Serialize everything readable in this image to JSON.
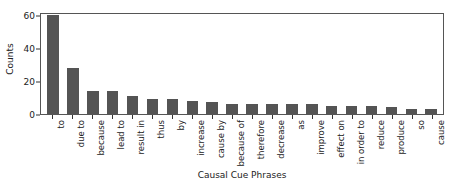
{
  "chart_data": {
    "type": "bar",
    "title": "",
    "xlabel": "Causal Cue Phrases",
    "ylabel": "Counts",
    "ylim": [
      0,
      62
    ],
    "yticks": [
      0,
      20,
      40,
      60
    ],
    "grid": false,
    "legend": null,
    "bar_color": "#545454",
    "categories": [
      "to",
      "due to",
      "because",
      "lead to",
      "result in",
      "thus",
      "by",
      "increase",
      "cause by",
      "because of",
      "therefore",
      "decrease",
      "as",
      "improve",
      "effect on",
      "in order to",
      "reduce",
      "produce",
      "so",
      "cause"
    ],
    "values": [
      60,
      28,
      14,
      14,
      11,
      9,
      9,
      8,
      7,
      6,
      6,
      6,
      6,
      6,
      5,
      5,
      5,
      4,
      3,
      3
    ]
  }
}
